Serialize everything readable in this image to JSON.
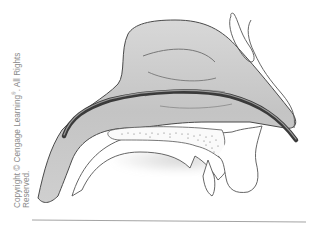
{
  "figure": {
    "copyright_line1": "Copyright © Cengage Learning",
    "copyright_mark": "®",
    "copyright_line1_tail": ". All Rights",
    "copyright_line2": "Reserved."
  },
  "colors": {
    "cavity_fill": "#c9c9c9",
    "outline": "#4a4a4a",
    "tube": "#3a3a3a",
    "palate_fill": "#ffffff",
    "baseline": "#999999"
  }
}
